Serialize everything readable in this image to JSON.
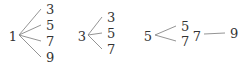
{
  "diagram": {
    "type": "tree-diagram",
    "colors": {
      "text": "#333333",
      "line": "#888888",
      "background": "#ffffff"
    },
    "trees": [
      {
        "root": {
          "label": "1",
          "x": 13,
          "y": 37
        },
        "origin": {
          "x": 19,
          "y": 35
        },
        "leaves": [
          {
            "label": "3",
            "x": 45,
            "y": 13
          },
          {
            "label": "5",
            "x": 45,
            "y": 29
          },
          {
            "label": "7",
            "x": 45,
            "y": 45
          },
          {
            "label": "9",
            "x": 45,
            "y": 61
          }
        ]
      },
      {
        "root": {
          "label": "3",
          "x": 82,
          "y": 37
        },
        "origin": {
          "x": 88,
          "y": 35
        },
        "leaves": [
          {
            "label": "3",
            "x": 106,
            "y": 21
          },
          {
            "label": "5",
            "x": 106,
            "y": 37
          },
          {
            "label": "7",
            "x": 106,
            "y": 53
          }
        ]
      },
      {
        "root": {
          "label": "5",
          "x": 148,
          "y": 37
        },
        "origin": {
          "x": 155,
          "y": 35
        },
        "leaves": [
          {
            "label": "5",
            "x": 180,
            "y": 30
          },
          {
            "label": "7",
            "x": 180,
            "y": 45
          }
        ]
      },
      {
        "root": {
          "label": "7",
          "x": 197,
          "y": 37
        },
        "origin": {
          "x": 204,
          "y": 34
        },
        "leaves": [
          {
            "label": "9",
            "x": 229,
            "y": 37
          }
        ]
      }
    ]
  }
}
